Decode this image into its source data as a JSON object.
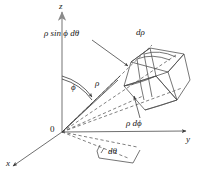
{
  "figure": {
    "background_color": "#ffffff",
    "line_color": "#3a3a3a",
    "axis_color": "#9a9a9a",
    "text_color": "#1a1a1a"
  },
  "axes": [
    {
      "name": "z-axis",
      "label": "z",
      "direction": "up"
    },
    {
      "name": "y-axis",
      "label": "y",
      "direction": "right"
    },
    {
      "name": "x-axis",
      "label": "x",
      "direction": "lower-left"
    }
  ],
  "origin": {
    "label": "0"
  },
  "annotations": [
    {
      "name": "arc-length-theta",
      "label": "ρ sin ϕ dθ"
    },
    {
      "name": "radial-thickness",
      "label": "dρ"
    },
    {
      "name": "arc-length-phi",
      "label": "ρ dϕ"
    },
    {
      "name": "polar-angle",
      "label": "ϕ"
    },
    {
      "name": "radius",
      "label": "ρ"
    },
    {
      "name": "azimuthal-increment",
      "label": "dθ"
    }
  ]
}
